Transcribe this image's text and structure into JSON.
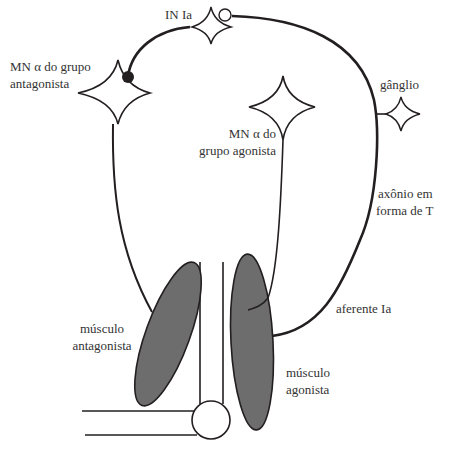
{
  "labels": {
    "in_ia": "IN Ia",
    "mn_antagonist_line1": "MN α do grupo",
    "mn_antagonist_line2": "antagonista",
    "mn_agonist_line1": "MN α do",
    "mn_agonist_line2": "grupo agonista",
    "ganglion": "gânglio",
    "t_axon_line1": "axônio em",
    "t_axon_line2": "forma de T",
    "afferent_ia": "aferente Ia",
    "muscle_antagonist_line1": "músculo",
    "muscle_antagonist_line2": "antagonista",
    "muscle_agonist_line1": "músculo",
    "muscle_agonist_line2": "agonista"
  },
  "colors": {
    "line": "#231f20",
    "muscle_fill": "#6d6d6d",
    "inhibitory_terminal": "#231f20",
    "background": "#ffffff",
    "text": "#333333"
  }
}
